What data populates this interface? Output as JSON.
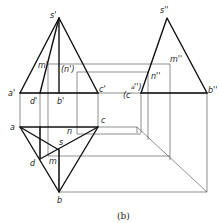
{
  "caption": "(b)",
  "labels": {
    "s_front": "s'",
    "m_front": "m'",
    "n_front": "(n')",
    "a_front": "a'",
    "d_front": "d'",
    "b_front": "b'",
    "c_front": "c'",
    "s_side": "s''",
    "m_side": "m''",
    "n_side": "n''",
    "ca_side": "(c''a'')",
    "c_side_main": "(c",
    "a_side_sup": "a",
    "c_side_close": "'')",
    "b_side": "b''",
    "a_top": "a",
    "c_top": "c",
    "n_top": "n",
    "s_top": "s",
    "d_top": "d",
    "m_top": "m",
    "b_top": "b"
  },
  "colors": {
    "line": "#111111",
    "projection": "#444444",
    "background": "#ffffff"
  }
}
